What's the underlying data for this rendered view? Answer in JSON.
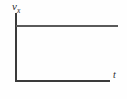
{
  "figure": {
    "kind": "line-graph",
    "background_color": "#fefefe",
    "axis_color": "#3a3a3a",
    "data_line_color": "#5a5a5a",
    "y_axis_label": "v",
    "y_axis_label_subscript": "x",
    "x_axis_label": "t"
  },
  "chart_data": {
    "type": "line",
    "title": "",
    "subtitle": "",
    "xlabel": "t",
    "ylabel": "v_x",
    "grid": false,
    "legend": null,
    "annotations": [],
    "axis_ticks": {
      "x": [],
      "y": []
    },
    "xlim": [
      0,
      1
    ],
    "ylim": [
      0,
      1
    ],
    "series": [
      {
        "name": "v_x",
        "x": [
          0,
          1
        ],
        "values": [
          0.8,
          0.8
        ],
        "description": "constant positive velocity, horizontal line"
      }
    ]
  }
}
